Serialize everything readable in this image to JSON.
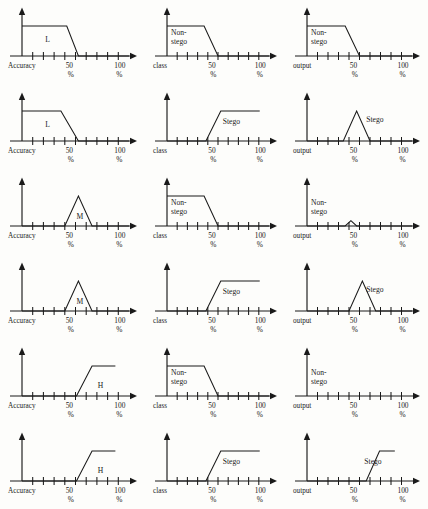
{
  "figure": {
    "type": "fuzzy-membership-function-grid",
    "rows": 6,
    "columns": 3,
    "background_color": "#fdfdfb",
    "line_color": "#1a1a1a"
  },
  "axes": {
    "tick_labels": [
      "50",
      "100"
    ],
    "percent_symbol": "%",
    "tick_count": 10,
    "column_axis_labels": [
      "Accuracy",
      "class",
      "output"
    ]
  },
  "chart_data": {
    "type": "line",
    "title": "",
    "xlabel": "",
    "ylabel": "",
    "xlim": [
      0,
      110
    ],
    "ylim": [
      0,
      1
    ],
    "grid": false,
    "legend_position": "inline-annotation",
    "xticks": [
      0,
      11,
      22,
      33,
      44,
      55,
      66,
      77,
      88,
      99
    ],
    "xtick_labels": {
      "50": 50,
      "100": 100
    },
    "panels": [
      {
        "row": 1,
        "column": 1,
        "axis_label": "Accuracy",
        "curve_label": "L",
        "shape": "falling-trapezoid",
        "points": [
          [
            0,
            1
          ],
          [
            46,
            1
          ],
          [
            58,
            0
          ],
          [
            110,
            0
          ]
        ]
      },
      {
        "row": 1,
        "column": 2,
        "axis_label": "class",
        "curve_label": "Non-stego",
        "shape": "falling-trapezoid",
        "points": [
          [
            0,
            1
          ],
          [
            40,
            1
          ],
          [
            55,
            0
          ],
          [
            110,
            0
          ]
        ]
      },
      {
        "row": 1,
        "column": 3,
        "axis_label": "output",
        "curve_label": "Non-stego",
        "shape": "falling-trapezoid",
        "points": [
          [
            0,
            1
          ],
          [
            40,
            1
          ],
          [
            55,
            0
          ],
          [
            110,
            0
          ]
        ]
      },
      {
        "row": 2,
        "column": 1,
        "axis_label": "Accuracy",
        "curve_label": "L",
        "shape": "falling-trapezoid",
        "points": [
          [
            0,
            1
          ],
          [
            40,
            1
          ],
          [
            58,
            0
          ],
          [
            110,
            0
          ]
        ]
      },
      {
        "row": 2,
        "column": 2,
        "axis_label": "class",
        "curve_label": "Stego",
        "shape": "rising-trapezoid",
        "points": [
          [
            0,
            0
          ],
          [
            42,
            0
          ],
          [
            58,
            1
          ],
          [
            100,
            1
          ]
        ]
      },
      {
        "row": 2,
        "column": 3,
        "axis_label": "output",
        "curve_label": "Stego",
        "shape": "triangle",
        "points": [
          [
            0,
            0
          ],
          [
            38,
            0
          ],
          [
            52,
            1
          ],
          [
            66,
            0
          ],
          [
            110,
            0
          ]
        ]
      },
      {
        "row": 3,
        "column": 1,
        "axis_label": "Accuracy",
        "curve_label": "M",
        "shape": "triangle",
        "points": [
          [
            0,
            0
          ],
          [
            44,
            0
          ],
          [
            58,
            1
          ],
          [
            72,
            0
          ],
          [
            110,
            0
          ]
        ]
      },
      {
        "row": 3,
        "column": 2,
        "axis_label": "class",
        "curve_label": "Non-stego",
        "shape": "falling-trapezoid",
        "points": [
          [
            0,
            1
          ],
          [
            40,
            1
          ],
          [
            55,
            0
          ],
          [
            110,
            0
          ]
        ]
      },
      {
        "row": 3,
        "column": 3,
        "axis_label": "output",
        "curve_label": "Non-stego",
        "shape": "small-triangle",
        "points": [
          [
            0,
            0
          ],
          [
            40,
            0
          ],
          [
            46,
            0.18
          ],
          [
            52,
            0
          ],
          [
            110,
            0
          ]
        ]
      },
      {
        "row": 4,
        "column": 1,
        "axis_label": "Accuracy",
        "curve_label": "M",
        "shape": "triangle",
        "points": [
          [
            0,
            0
          ],
          [
            44,
            0
          ],
          [
            58,
            1
          ],
          [
            72,
            0
          ],
          [
            110,
            0
          ]
        ]
      },
      {
        "row": 4,
        "column": 2,
        "axis_label": "class",
        "curve_label": "Stego",
        "shape": "rising-trapezoid",
        "points": [
          [
            0,
            0
          ],
          [
            42,
            0
          ],
          [
            58,
            1
          ],
          [
            100,
            1
          ]
        ]
      },
      {
        "row": 4,
        "column": 3,
        "axis_label": "output",
        "curve_label": "Stego",
        "shape": "triangle",
        "points": [
          [
            0,
            0
          ],
          [
            44,
            0
          ],
          [
            58,
            1
          ],
          [
            72,
            0
          ],
          [
            110,
            0
          ]
        ]
      },
      {
        "row": 5,
        "column": 1,
        "axis_label": "Accuracy",
        "curve_label": "H",
        "shape": "rising-trapezoid",
        "points": [
          [
            0,
            0
          ],
          [
            56,
            0
          ],
          [
            72,
            1
          ],
          [
            96,
            1
          ]
        ]
      },
      {
        "row": 5,
        "column": 2,
        "axis_label": "class",
        "curve_label": "Non-stego",
        "shape": "falling-trapezoid",
        "points": [
          [
            0,
            1
          ],
          [
            40,
            1
          ],
          [
            55,
            0
          ],
          [
            110,
            0
          ]
        ]
      },
      {
        "row": 5,
        "column": 3,
        "axis_label": "output",
        "curve_label": "Non-stego",
        "shape": "flat-zero",
        "points": [
          [
            0,
            0
          ],
          [
            110,
            0
          ]
        ]
      },
      {
        "row": 6,
        "column": 1,
        "axis_label": "Accuracy",
        "curve_label": "H",
        "shape": "rising-trapezoid",
        "points": [
          [
            0,
            0
          ],
          [
            56,
            0
          ],
          [
            72,
            1
          ],
          [
            96,
            1
          ]
        ]
      },
      {
        "row": 6,
        "column": 2,
        "axis_label": "class",
        "curve_label": "Stego",
        "shape": "rising-trapezoid",
        "points": [
          [
            0,
            0
          ],
          [
            42,
            0
          ],
          [
            58,
            1
          ],
          [
            100,
            1
          ]
        ]
      },
      {
        "row": 6,
        "column": 3,
        "axis_label": "output",
        "curve_label": "Stego",
        "shape": "rising-trapezoid",
        "points": [
          [
            0,
            0
          ],
          [
            62,
            0
          ],
          [
            76,
            1
          ],
          [
            92,
            1
          ]
        ]
      }
    ]
  }
}
